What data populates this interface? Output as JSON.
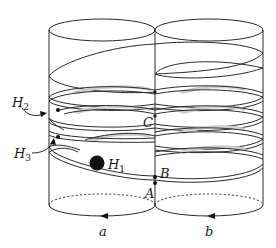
{
  "figure": {
    "labels": {
      "H2": {
        "main": "H",
        "sub": "2"
      },
      "H3": {
        "main": "H",
        "sub": "3"
      },
      "H1": {
        "main": "H",
        "sub": "1"
      },
      "A": "A",
      "B": "B",
      "C": "C",
      "a": "a",
      "b": "b"
    },
    "colors": {
      "stroke": "#2a2a2a",
      "band_shading": "#cfcfcf",
      "background": "#ffffff",
      "disk": "#111111"
    }
  }
}
